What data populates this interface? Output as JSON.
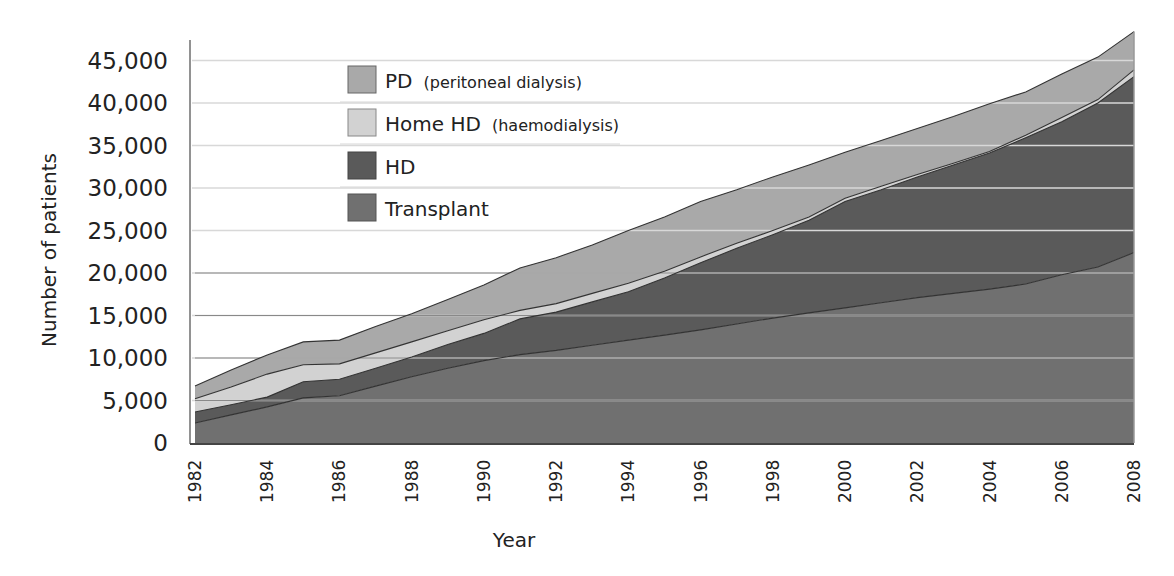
{
  "chart_data": {
    "type": "area",
    "stacked": true,
    "title": "",
    "xlabel": "Year",
    "ylabel": "Number of patients",
    "ylim": [
      0,
      48500
    ],
    "xlim": [
      1982,
      2008
    ],
    "grid": true,
    "legend_position": "upper-left-inside",
    "y_ticks": [
      0,
      5000,
      10000,
      15000,
      20000,
      25000,
      30000,
      35000,
      40000,
      45000
    ],
    "y_tick_labels": [
      "0",
      "5,000",
      "10,000",
      "15,000",
      "20,000",
      "25,000",
      "30,000",
      "35,000",
      "40,000",
      "45,000"
    ],
    "x_ticks": [
      1982,
      1984,
      1986,
      1988,
      1990,
      1992,
      1994,
      1996,
      1998,
      2000,
      2002,
      2004,
      2006,
      2008
    ],
    "x_tick_labels": [
      "1982",
      "1984",
      "1986",
      "1988",
      "1990",
      "1992",
      "1994",
      "1996",
      "1998",
      "2000",
      "2002",
      "2004",
      "2006",
      "2008"
    ],
    "x": [
      1982,
      1983,
      1984,
      1985,
      1986,
      1987,
      1988,
      1989,
      1990,
      1991,
      1992,
      1993,
      1994,
      1995,
      1996,
      1997,
      1998,
      1999,
      2000,
      2001,
      2002,
      2003,
      2004,
      2005,
      2006,
      2007,
      2008
    ],
    "series": [
      {
        "name": "Transplant",
        "color": "#707070",
        "values": [
          2350,
          3300,
          4250,
          5300,
          5550,
          6700,
          7800,
          8800,
          9700,
          10400,
          10900,
          11500,
          12100,
          12700,
          13300,
          14000,
          14700,
          15300,
          15900,
          16500,
          17100,
          17600,
          18100,
          18700,
          19800,
          20700,
          22400
        ]
      },
      {
        "name": "HD",
        "color": "#5a5a5a",
        "values": [
          1300,
          1200,
          1150,
          1900,
          1950,
          2100,
          2300,
          2800,
          3200,
          4200,
          4500,
          5100,
          5700,
          6700,
          7900,
          8900,
          9800,
          10900,
          12500,
          13300,
          14200,
          15100,
          16000,
          17200,
          18000,
          19300,
          20700
        ]
      },
      {
        "name": "Home HD (haemodialysis)",
        "color": "#d2d2d2",
        "values": [
          1550,
          2100,
          2700,
          2000,
          1800,
          1800,
          1800,
          1600,
          1600,
          1000,
          1000,
          1000,
          1000,
          800,
          700,
          600,
          500,
          400,
          400,
          400,
          300,
          200,
          200,
          300,
          500,
          400,
          800
        ]
      },
      {
        "name": "PD (peritoneal dialysis)",
        "color": "#a9a9a9",
        "values": [
          1500,
          2000,
          2250,
          2700,
          2800,
          3100,
          3300,
          3700,
          4100,
          5000,
          5400,
          5700,
          6200,
          6400,
          6500,
          6300,
          6300,
          6100,
          5400,
          5400,
          5400,
          5500,
          5600,
          5100,
          5100,
          5000,
          4500
        ]
      }
    ]
  },
  "legend": {
    "items": [
      {
        "main": "PD",
        "sub": "(peritoneal dialysis)",
        "color": "#a9a9a9"
      },
      {
        "main": "Home HD",
        "sub": "(haemodialysis)",
        "color": "#d2d2d2"
      },
      {
        "main": "HD",
        "sub": "",
        "color": "#5a5a5a"
      },
      {
        "main": "Transplant",
        "sub": "",
        "color": "#707070"
      }
    ]
  },
  "axes": {
    "x_title": "Year",
    "y_title": "Number of patients"
  },
  "colors": {
    "gridline_light": "#d8d8d8",
    "gridline_dark": "#4a4a4a",
    "axis_line": "#777777",
    "boundary_line": "#333333"
  }
}
